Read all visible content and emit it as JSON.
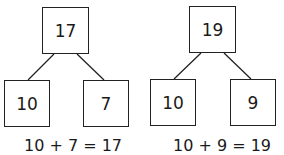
{
  "diagrams": [
    {
      "whole": "17",
      "parts": [
        "10",
        "7"
      ],
      "equation": "10 + 7 = 17"
    },
    {
      "whole": "19",
      "parts": [
        "10",
        "9"
      ],
      "equation": "10 + 9 = 19"
    }
  ]
}
